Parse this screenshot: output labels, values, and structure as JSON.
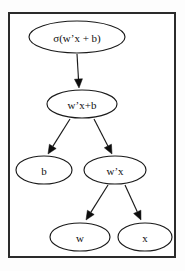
{
  "figure": {
    "kind": "computation-graph",
    "frame": {
      "visible": true,
      "color": "#2b2b2b"
    },
    "background_color": "#ffffff",
    "node_fill": "#ffffff",
    "node_stroke": "#1a1a1a",
    "edge_color": "#1a1a1a"
  },
  "nodes": [
    {
      "id": "sigma",
      "label": "σ(w’x + b)",
      "cx": 77,
      "cy": 37,
      "rx": 48,
      "ry": 16,
      "font_size": 11
    },
    {
      "id": "wxplusb",
      "label": "w’x+b",
      "cx": 82,
      "cy": 104,
      "rx": 35,
      "ry": 14,
      "font_size": 11
    },
    {
      "id": "b",
      "label": "b",
      "cx": 44,
      "cy": 170,
      "rx": 28,
      "ry": 14,
      "font_size": 11
    },
    {
      "id": "wx",
      "label": "w’x",
      "cx": 115,
      "cy": 170,
      "rx": 31,
      "ry": 14,
      "font_size": 11
    },
    {
      "id": "w",
      "label": "w",
      "cx": 80,
      "cy": 237,
      "rx": 30,
      "ry": 14,
      "font_size": 11
    },
    {
      "id": "x",
      "label": "x",
      "cx": 145,
      "cy": 237,
      "rx": 27,
      "ry": 14,
      "font_size": 11
    }
  ],
  "edges": [
    {
      "id": "e1",
      "from": "sigma",
      "to": "wxplusb",
      "x1": 77,
      "y1": 54,
      "x2": 79,
      "y2": 88
    },
    {
      "id": "e2",
      "from": "wxplusb",
      "to": "b",
      "x1": 70,
      "y1": 119,
      "x2": 48,
      "y2": 154
    },
    {
      "id": "e3",
      "from": "wxplusb",
      "to": "wx",
      "x1": 94,
      "y1": 119,
      "x2": 112,
      "y2": 154
    },
    {
      "id": "e4",
      "from": "wx",
      "to": "w",
      "x1": 108,
      "y1": 185,
      "x2": 86,
      "y2": 220
    },
    {
      "id": "e5",
      "from": "wx",
      "to": "x",
      "x1": 125,
      "y1": 185,
      "x2": 141,
      "y2": 220
    }
  ]
}
